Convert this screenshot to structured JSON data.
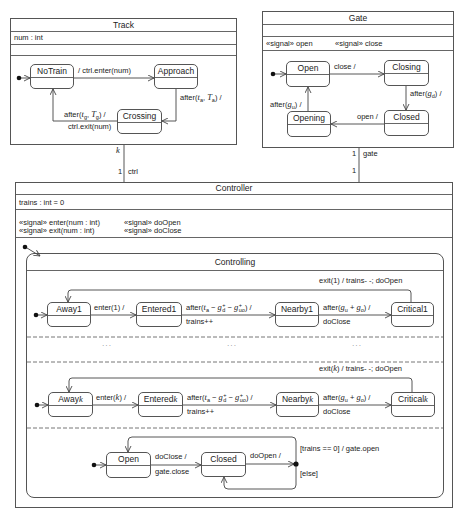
{
  "track": {
    "title": "Track",
    "attribute": "num : int",
    "states": {
      "no_train": "NoTrain",
      "approach": "Approach",
      "crossing": "Crossing"
    },
    "transitions": {
      "notrain_to_approach": "/ ctrl.enter(num)",
      "approach_to_crossing": [
        "after(",
        "t",
        "a",
        ", ",
        "T",
        "a",
        ") /"
      ],
      "crossing_to_notrain_trigger": [
        "after(",
        "t",
        "g",
        ", ",
        "T",
        "g",
        ") /"
      ],
      "crossing_to_notrain_effect": "ctrl.exit(num)"
    }
  },
  "gate": {
    "title": "Gate",
    "signals": [
      "«signal» open",
      "«signal» close"
    ],
    "states": {
      "open": "Open",
      "closing": "Closing",
      "closed": "Closed",
      "opening": "Opening"
    },
    "transitions": {
      "open_to_closing": "close /",
      "closing_to_closed": [
        "after(",
        "g",
        "d",
        ") /"
      ],
      "closed_to_opening": "open /",
      "opening_to_open": [
        "after(",
        "g",
        "u",
        ") /"
      ]
    }
  },
  "associations": {
    "track_controller": {
      "track_multiplicity": "k",
      "controller_multiplicity": "1",
      "controller_role": "ctrl"
    },
    "gate_controller": {
      "gate_multiplicity": "1",
      "gate_role": "gate",
      "controller_multiplicity": "1"
    }
  },
  "controller": {
    "title": "Controller",
    "attribute": "trains : int = 0",
    "signals": [
      "«signal» enter(num : int)",
      "«signal» exit(num : int)",
      "«signal» doOpen",
      "«signal» doClose"
    ],
    "controlling": {
      "title": "Controlling",
      "region_1": {
        "away": "Away1",
        "entered": "Entered1",
        "nearby": "Nearby1",
        "critical": "Critical1",
        "enter": "enter(1) /",
        "exit": "exit(1) / trains- -; doOpen"
      },
      "region_k": {
        "away": [
          "Away",
          "k"
        ],
        "entered": [
          "Entered",
          "k"
        ],
        "nearby": [
          "Nearby",
          "k"
        ],
        "critical": [
          "Critical",
          "k"
        ],
        "enter": [
          "enter(",
          "k",
          ") /"
        ],
        "exit": [
          "exit(",
          "k",
          ") / trains- -; doOpen"
        ]
      },
      "shared": {
        "entered_to_nearby": [
          "after(",
          "t",
          "a",
          " − ",
          "g",
          "+",
          "d",
          " − ",
          "g",
          "+",
          "uo",
          ") /"
        ],
        "entered_to_nearby_effect": "trains++",
        "nearby_to_critical": [
          "after(",
          "g",
          "u",
          " + ",
          "g",
          "o",
          ") /"
        ],
        "nearby_to_critical_effect": "doClose"
      },
      "ellipsis": [
        "···",
        "···",
        "···"
      ],
      "gate_region": {
        "open": "Open",
        "closed": "Closed",
        "open_to_closed_trigger": "doClose /",
        "open_to_closed_effect": "gate.close",
        "closed_to_choice": "doOpen /",
        "guard_zero": "[trains == 0] / gate.open",
        "guard_else": "[else]"
      }
    }
  }
}
